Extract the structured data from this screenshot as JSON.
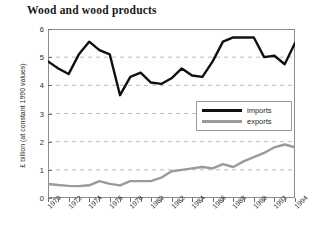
{
  "chart_data": {
    "type": "line",
    "title": "Wood and wood products",
    "xlabel": "",
    "ylabel": "£ billion (at constant 1990 values)",
    "ylim": [
      0,
      6
    ],
    "xlim": [
      1970,
      1994
    ],
    "yticks": [
      0,
      1,
      2,
      3,
      4,
      5,
      6
    ],
    "ytick_labels": [
      "0",
      "1",
      "2",
      "3",
      "4",
      "5",
      "6"
    ],
    "xticks": [
      1970,
      1971,
      1972,
      1973,
      1974,
      1975,
      1976,
      1977,
      1978,
      1979,
      1980,
      1981,
      1982,
      1983,
      1984,
      1985,
      1986,
      1987,
      1988,
      1989,
      1990,
      1991,
      1992,
      1993,
      1994
    ],
    "xtick_labels_shown": [
      "1970",
      "1972",
      "1974",
      "1976",
      "1978",
      "1980",
      "1982",
      "1984",
      "1986",
      "1988",
      "1990",
      "1992",
      "1994"
    ],
    "grid": true,
    "grid_style": "dashed-horizontal",
    "legend_position": "center-right",
    "x": [
      1970,
      1971,
      1972,
      1973,
      1974,
      1975,
      1976,
      1977,
      1978,
      1979,
      1980,
      1981,
      1982,
      1983,
      1984,
      1985,
      1986,
      1987,
      1988,
      1989,
      1990,
      1991,
      1992,
      1993,
      1994
    ],
    "series": [
      {
        "name": "imports",
        "color": "#101010",
        "values": [
          4.85,
          4.6,
          4.4,
          5.1,
          5.55,
          5.25,
          5.1,
          3.65,
          4.3,
          4.45,
          4.1,
          4.05,
          4.25,
          4.6,
          4.35,
          4.3,
          4.85,
          5.55,
          5.7,
          5.7,
          5.7,
          5.0,
          5.05,
          4.75,
          5.5
        ]
      },
      {
        "name": "exports",
        "color": "#9a9a9a",
        "values": [
          0.5,
          0.46,
          0.43,
          0.42,
          0.45,
          0.6,
          0.5,
          0.45,
          0.6,
          0.6,
          0.6,
          0.72,
          0.95,
          1.0,
          1.05,
          1.1,
          1.05,
          1.2,
          1.1,
          1.3,
          1.45,
          1.6,
          1.8,
          1.9,
          1.8
        ]
      }
    ]
  },
  "legend": {
    "items": [
      {
        "label": "imports",
        "key": "imports"
      },
      {
        "label": "exports",
        "key": "exports"
      }
    ]
  }
}
